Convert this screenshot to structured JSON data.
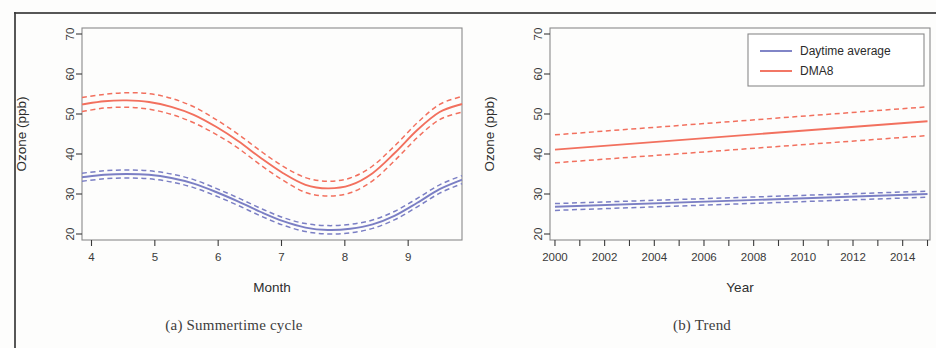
{
  "figure": {
    "panels": [
      {
        "id": "a",
        "caption": "(a) Summertime cycle",
        "xlabel": "Month",
        "ylabel": "Ozone (ppb)"
      },
      {
        "id": "b",
        "caption": "(b) Trend",
        "xlabel": "Year",
        "ylabel": "Ozone (ppb)"
      }
    ]
  },
  "legend": {
    "position": "top-right",
    "items": [
      {
        "label": "Daytime average",
        "color": "#7B7FC4"
      },
      {
        "label": "DMA8",
        "color": "#F2705E"
      }
    ]
  },
  "colors": {
    "daytime_average": "#7B7FC4",
    "dma8": "#F2705E",
    "axis": "#3a3a3a",
    "frame": "#8a8a8a"
  },
  "chart_data": [
    {
      "type": "line",
      "title": "(a) Summertime cycle",
      "xlabel": "Month",
      "ylabel": "Ozone (ppb)",
      "xlim": [
        3.85,
        9.85
      ],
      "ylim": [
        18.5,
        71.5
      ],
      "xticks": [
        4,
        5,
        6,
        7,
        8,
        9
      ],
      "xticklabels": [
        "4",
        "5",
        "6",
        "7",
        "8",
        "9"
      ],
      "yticks": [
        20,
        30,
        40,
        50,
        60,
        70
      ],
      "yticklabels": [
        "20",
        "30",
        "40",
        "50",
        "60",
        "70"
      ],
      "grid": false,
      "legend": "none",
      "x": [
        4.0,
        4.3,
        4.6,
        5.0,
        5.4,
        5.8,
        6.2,
        6.6,
        7.0,
        7.4,
        7.8,
        8.2,
        8.6,
        9.0,
        9.4,
        9.8
      ],
      "series": [
        {
          "name": "DMA8",
          "color": "#F2705E",
          "style": "solid",
          "values": [
            52.4,
            53.2,
            53.4,
            53.0,
            51.8,
            49.8,
            46.8,
            43.2,
            39.0,
            35.2,
            32.3,
            31.4,
            32.2,
            35.2,
            40.3,
            46.0,
            50.5,
            52.5
          ]
        },
        {
          "name": "DMA8 upper CI",
          "color": "#F2705E",
          "style": "dashed",
          "values": [
            54.1,
            54.9,
            55.3,
            55.1,
            53.9,
            51.8,
            48.6,
            44.9,
            40.7,
            36.9,
            34.1,
            33.2,
            34.0,
            37.0,
            42.1,
            47.8,
            52.4,
            54.4
          ]
        },
        {
          "name": "DMA8 lower CI",
          "color": "#F2705E",
          "style": "dashed",
          "values": [
            50.6,
            51.5,
            51.7,
            51.2,
            49.9,
            47.8,
            44.9,
            41.4,
            37.2,
            33.4,
            30.4,
            29.5,
            30.3,
            33.3,
            38.4,
            44.1,
            48.6,
            50.5
          ]
        },
        {
          "name": "Daytime average",
          "color": "#7B7FC4",
          "style": "solid",
          "values": [
            34.2,
            34.8,
            35.0,
            34.8,
            34.0,
            32.6,
            30.5,
            28.1,
            25.5,
            23.2,
            21.6,
            21.0,
            21.3,
            22.4,
            24.6,
            27.8,
            31.2,
            33.6
          ]
        },
        {
          "name": "Daytime average upper CI",
          "color": "#7B7FC4",
          "style": "dashed",
          "values": [
            35.2,
            35.8,
            36.0,
            35.8,
            35.0,
            33.6,
            31.4,
            29.0,
            26.4,
            24.1,
            22.6,
            22.1,
            22.4,
            23.5,
            25.7,
            28.9,
            32.3,
            34.6
          ]
        },
        {
          "name": "Daytime average lower CI",
          "color": "#7B7FC4",
          "style": "dashed",
          "values": [
            33.2,
            33.8,
            34.0,
            33.8,
            33.0,
            31.6,
            29.5,
            27.1,
            24.5,
            22.2,
            20.6,
            20.0,
            20.3,
            21.4,
            23.6,
            26.8,
            30.2,
            32.6
          ]
        }
      ]
    },
    {
      "type": "line",
      "title": "(b) Trend",
      "xlabel": "Year",
      "ylabel": "Ozone (ppb)",
      "xlim": [
        1999.8,
        2015.1
      ],
      "ylim": [
        18.5,
        71.5
      ],
      "xticks": [
        2000,
        2001,
        2002,
        2003,
        2004,
        2005,
        2006,
        2007,
        2008,
        2009,
        2010,
        2011,
        2012,
        2013,
        2014,
        2015
      ],
      "xticklabels": [
        "2000",
        "",
        "2002",
        "",
        "2004",
        "",
        "2006",
        "",
        "2008",
        "",
        "2010",
        "",
        "2012",
        "",
        "2014",
        ""
      ],
      "yticks": [
        20,
        30,
        40,
        50,
        60,
        70
      ],
      "yticklabels": [
        "20",
        "30",
        "40",
        "50",
        "60",
        "70"
      ],
      "grid": false,
      "legend": "top-right",
      "x": [
        2000,
        2015
      ],
      "series": [
        {
          "name": "DMA8",
          "color": "#F2705E",
          "style": "solid",
          "values": [
            41.1,
            48.2
          ]
        },
        {
          "name": "DMA8 upper CI",
          "color": "#F2705E",
          "style": "dashed",
          "values": [
            44.8,
            51.8
          ]
        },
        {
          "name": "DMA8 lower CI",
          "color": "#F2705E",
          "style": "dashed",
          "values": [
            37.8,
            44.6
          ]
        },
        {
          "name": "Daytime average",
          "color": "#7B7FC4",
          "style": "solid",
          "values": [
            26.8,
            30.0
          ]
        },
        {
          "name": "Daytime average upper CI",
          "color": "#7B7FC4",
          "style": "dashed",
          "values": [
            27.6,
            30.7
          ]
        },
        {
          "name": "Daytime average lower CI",
          "color": "#7B7FC4",
          "style": "dashed",
          "values": [
            25.9,
            29.2
          ]
        }
      ]
    }
  ]
}
